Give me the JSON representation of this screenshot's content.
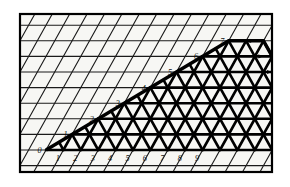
{
  "figure": {
    "frame": {
      "x": 20,
      "y": 14,
      "width": 252,
      "height": 158
    },
    "colors": {
      "background": "#ffffff",
      "paper": "#f7f7f4",
      "grid_light": "#1a1a1a",
      "grid_bold": "#000000",
      "frame": "#000000",
      "label": "#111111"
    },
    "lattice": {
      "origin": {
        "x": 46,
        "y": 150
      },
      "step_x": 17.4,
      "step_y": 15.6,
      "shear_x": 8.7,
      "light_line_width": 1.1,
      "bold_line_width": 2.6
    }
  },
  "axis_left": {
    "name": "left-diagonal-axis",
    "ticks": [
      "0",
      "1",
      "2",
      "3",
      "4",
      "5",
      "6",
      "7"
    ]
  },
  "axis_bottom": {
    "name": "bottom-axis",
    "ticks": [
      "1",
      "2",
      "3",
      "4",
      "5",
      "6",
      "7",
      "8",
      "9"
    ]
  },
  "points": [
    {
      "label": "A",
      "x": 9,
      "y": 0
    }
  ],
  "region": {
    "name": "bold-hexagon",
    "vertices": [
      {
        "x": 0,
        "y": 0
      },
      {
        "x": 7,
        "y": 7
      },
      {
        "x": 12,
        "y": 7
      },
      {
        "x": 9,
        "y": 0
      }
    ]
  },
  "arrows": {
    "direction": "right",
    "count": 8,
    "rows": [
      0,
      1,
      2,
      3,
      4,
      5,
      6,
      7
    ]
  }
}
